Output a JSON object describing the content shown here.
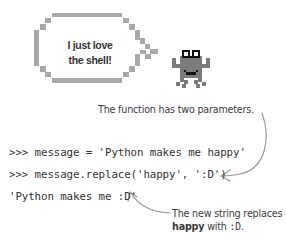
{
  "speech_bubble": {
    "line1": "I just love",
    "line2": "the shell!"
  },
  "annotations": {
    "top": "The function has two parameters.",
    "bottom_line1": "The new string replaces",
    "bottom_line2_word": "happy",
    "bottom_line2_mid": " with ",
    "bottom_line2_code": ":D",
    "bottom_line2_end": "."
  },
  "code_lines": [
    ">>> message = 'Python makes me happy'",
    ">>> message.replace('happy', ':D')",
    "'Python makes me :D'"
  ],
  "colors": {
    "bubble_border": "#a8a8a8",
    "crab_body": "#7a7a7a",
    "arrow": "#9a9a9a",
    "text": "#333333"
  }
}
